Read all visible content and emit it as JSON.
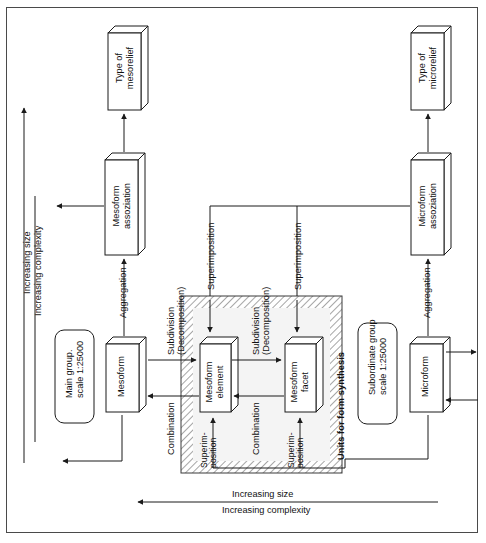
{
  "diagram": {
    "axes": {
      "left_vertical": {
        "line1": "Increasing size",
        "line2": "Increasing complexity"
      },
      "bottom_horizontal": {
        "line1": "Increasing size",
        "line2": "Increasing complexity"
      }
    },
    "boxes": [
      {
        "id": "type-of-mesorelief",
        "line1": "Type of",
        "line2": "mesorelief"
      },
      {
        "id": "mesoform-assoziation",
        "line1": "Mesoform",
        "line2": "assoziation"
      },
      {
        "id": "mesoform",
        "line1": "Mesoform",
        "line2": ""
      },
      {
        "id": "mesoform-element",
        "line1": "Mesoform",
        "line2": "element"
      },
      {
        "id": "mesoform-facet",
        "line1": "Mesoform",
        "line2": "facet"
      },
      {
        "id": "microform",
        "line1": "Microform",
        "line2": ""
      },
      {
        "id": "microform-assoziation",
        "line1": "Microform",
        "line2": "assoziation"
      },
      {
        "id": "type-of-microrelief",
        "line1": "Type of",
        "line2": "microrelief"
      }
    ],
    "scale_tags": [
      {
        "id": "main-group",
        "line1": "Main group.",
        "line2": "scale  1:25000"
      },
      {
        "id": "subordinate-group",
        "line1": "Subordinate group",
        "line2": "scale 1:25000"
      }
    ],
    "region": {
      "label": "Units for form synthesis"
    },
    "relations": {
      "aggregation_left": "Aggregation",
      "aggregation_right": "Aggregation",
      "superimposition_left_top": "Superimposition",
      "superimposition_right_top": "Superimposition",
      "superimposition_elem_line1": "Superim-",
      "superimposition_elem_line2": "position",
      "superimposition_facet_line1": "Superim-",
      "superimposition_facet_line2": "position",
      "combination_left": "Combination",
      "combination_right": "Combination",
      "subdivision_left_line1": "Subdivision",
      "subdivision_left_line2": "(Decomposition)",
      "subdivision_right_line1": "Subdivision",
      "subdivision_right_line2": "(Decomposition)"
    },
    "colors": {
      "ink": "#1a1a1a",
      "frame": "#4a4a4a",
      "hatch": "#8a8a8a",
      "box_face": "#ffffff",
      "region_fill": "#f3f3f3"
    }
  }
}
